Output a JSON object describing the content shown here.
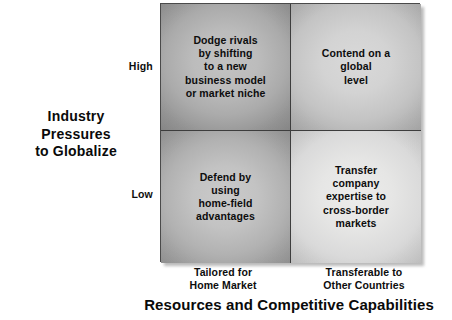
{
  "chart_data": {
    "type": "table",
    "title": "",
    "xlabel": "Resources and Competitive Capabilities",
    "ylabel": "Industry Pressures to Globalize",
    "x_categories": [
      "Tailored for Home Market",
      "Transferable to Other Countries"
    ],
    "y_categories": [
      "High",
      "Low"
    ],
    "grid": true,
    "legend": "none",
    "cells": [
      {
        "row": "High",
        "column": "Tailored for Home Market",
        "position": "top-left",
        "text": "Dodge rivals by shifting to a new business model or market niche",
        "lines": [
          "Dodge rivals",
          "by shifting",
          "to a new",
          "business model",
          "or market niche"
        ],
        "shade": "#ababab"
      },
      {
        "row": "High",
        "column": "Transferable to Other Countries",
        "position": "top-right",
        "text": "Contend on a global level",
        "lines": [
          "Contend on a",
          "global",
          "level"
        ],
        "shade": "#c4c4c4"
      },
      {
        "row": "Low",
        "column": "Tailored for Home Market",
        "position": "bottom-left",
        "text": "Defend by using home-field advantages",
        "lines": [
          "Defend by",
          "using",
          "home-field",
          "advantages"
        ],
        "shade": "#b2b2b2"
      },
      {
        "row": "Low",
        "column": "Transferable to Other Countries",
        "position": "bottom-right",
        "text": "Transfer company expertise to cross-border markets",
        "lines": [
          "Transfer",
          "company",
          "expertise to",
          "cross-border",
          "markets"
        ],
        "shade": "#dadada"
      }
    ]
  },
  "y_axis": {
    "title_line1": "Industry",
    "title_line2": "Pressures",
    "title_line3": "to Globalize",
    "tick_high": "High",
    "tick_low": "Low"
  },
  "x_axis": {
    "title": "Resources and Competitive Capabilities",
    "tick_left_line1": "Tailored for",
    "tick_left_line2": "Home Market",
    "tick_right_line1": "Transferable to",
    "tick_right_line2": "Other Countries"
  },
  "quadrants": {
    "top_left": {
      "l1": "Dodge rivals",
      "l2": "by shifting",
      "l3": "to a new",
      "l4": "business model",
      "l5": "or market niche"
    },
    "top_right": {
      "l1": "Contend on a",
      "l2": "global",
      "l3": "level"
    },
    "bottom_left": {
      "l1": "Defend by",
      "l2": "using",
      "l3": "home-field",
      "l4": "advantages"
    },
    "bottom_right": {
      "l1": "Transfer",
      "l2": "company",
      "l3": "expertise to",
      "l4": "cross-border",
      "l5": "markets"
    }
  },
  "colors": {
    "border": "#4a4a4a",
    "divider": "#3d3d3d",
    "text": "#0d0d0d",
    "background": "#ffffff"
  }
}
